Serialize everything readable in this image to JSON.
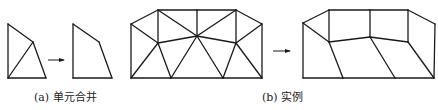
{
  "panels": [
    {
      "id": "a",
      "caption": "(a) 单元合并",
      "caption_pos": [
        34,
        91
      ],
      "before": {
        "nodes": [
          [
            8,
            24
          ],
          [
            33,
            42
          ],
          [
            46,
            78
          ],
          [
            8,
            78
          ]
        ],
        "edges": [
          [
            0,
            1
          ],
          [
            1,
            2
          ],
          [
            2,
            3
          ],
          [
            3,
            0
          ],
          [
            1,
            3
          ]
        ]
      },
      "arrow": {
        "from": [
          48,
          60
        ],
        "to": [
          64,
          60
        ]
      },
      "after": {
        "nodes": [
          [
            73,
            24
          ],
          [
            99,
            42
          ],
          [
            112,
            78
          ],
          [
            73,
            78
          ]
        ],
        "edges": [
          [
            0,
            1
          ],
          [
            1,
            2
          ],
          [
            2,
            3
          ],
          [
            3,
            0
          ]
        ]
      }
    },
    {
      "id": "b",
      "caption": "(b) 实例",
      "caption_pos": [
        262,
        91
      ],
      "before": {
        "nodes": [
          [
            131,
            24
          ],
          [
            158,
            10
          ],
          [
            197,
            10
          ],
          [
            236,
            10
          ],
          [
            262,
            24
          ],
          [
            158,
            43
          ],
          [
            197,
            36
          ],
          [
            236,
            43
          ],
          [
            131,
            78
          ],
          [
            171,
            78
          ],
          [
            223,
            78
          ],
          [
            262,
            78
          ]
        ],
        "edges": [
          [
            0,
            1
          ],
          [
            1,
            2
          ],
          [
            2,
            3
          ],
          [
            3,
            4
          ],
          [
            4,
            11
          ],
          [
            11,
            10
          ],
          [
            10,
            9
          ],
          [
            9,
            8
          ],
          [
            8,
            0
          ],
          [
            1,
            5
          ],
          [
            2,
            6
          ],
          [
            3,
            7
          ],
          [
            0,
            5
          ],
          [
            5,
            6
          ],
          [
            6,
            7
          ],
          [
            7,
            4
          ],
          [
            1,
            6
          ],
          [
            6,
            3
          ],
          [
            8,
            5
          ],
          [
            5,
            9
          ],
          [
            9,
            6
          ],
          [
            6,
            10
          ],
          [
            10,
            7
          ],
          [
            7,
            11
          ]
        ]
      },
      "arrow": {
        "from": [
          273,
          51
        ],
        "to": [
          290,
          51
        ]
      },
      "after": {
        "nodes": [
          [
            303,
            23
          ],
          [
            329,
            10
          ],
          [
            370,
            10
          ],
          [
            408,
            10
          ],
          [
            435,
            24
          ],
          [
            329,
            42
          ],
          [
            370,
            37
          ],
          [
            408,
            42
          ],
          [
            303,
            78
          ],
          [
            343,
            78
          ],
          [
            395,
            78
          ],
          [
            434,
            78
          ]
        ],
        "edges": [
          [
            0,
            1
          ],
          [
            1,
            2
          ],
          [
            2,
            3
          ],
          [
            3,
            4
          ],
          [
            4,
            11
          ],
          [
            11,
            10
          ],
          [
            10,
            9
          ],
          [
            9,
            8
          ],
          [
            8,
            0
          ],
          [
            1,
            5
          ],
          [
            2,
            6
          ],
          [
            3,
            7
          ],
          [
            0,
            5
          ],
          [
            5,
            6
          ],
          [
            6,
            7
          ],
          [
            5,
            9
          ],
          [
            6,
            10
          ],
          [
            7,
            11
          ]
        ]
      }
    }
  ],
  "colors": {
    "line": "#1a1a1a",
    "background": "#ffffff"
  }
}
